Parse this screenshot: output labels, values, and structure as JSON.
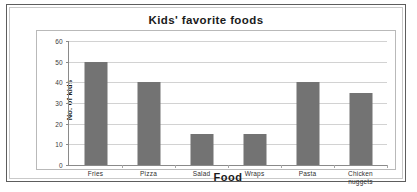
{
  "chart_data": {
    "type": "bar",
    "title": "Kids' favorite foods",
    "xlabel": "Food",
    "ylabel": "No. of kids",
    "categories": [
      "Fries",
      "Pizza",
      "Salad",
      "Wraps",
      "Pasta",
      "Chicken\nnuggets"
    ],
    "values": [
      50,
      40,
      15,
      15,
      40,
      35
    ],
    "ylim": [
      0,
      60
    ],
    "ytick_labels": [
      "0",
      "10",
      "20",
      "30",
      "40",
      "50",
      "60"
    ],
    "ytick_values": [
      0,
      10,
      20,
      30,
      40,
      50,
      60
    ],
    "grid": true,
    "legend": false,
    "bar_color": "#737373",
    "grid_color": "#d2d2d2",
    "axis_color": "#8a8a8a"
  }
}
